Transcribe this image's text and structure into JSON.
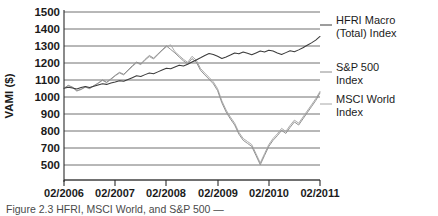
{
  "chart_data": {
    "type": "line",
    "title": "",
    "xlabel": "",
    "ylabel": "VAMI ($)",
    "ylim": [
      400,
      1500
    ],
    "xlim": [
      "02/2006",
      "02/2011"
    ],
    "grid": true,
    "legend_position": "right-inline",
    "y_ticks": [
      "1500",
      "1400",
      "1300",
      "1200",
      "1100",
      "1000",
      "900",
      "800",
      "700",
      "500"
    ],
    "x_ticks": [
      "02/2006",
      "02/2007",
      "02/2008",
      "02/2009",
      "02/2010",
      "02/2011"
    ],
    "series": [
      {
        "name": "HFRI Macro (Total) Index",
        "color": "#3b3b3b",
        "x": [
          0,
          1,
          2,
          3,
          4,
          5,
          6,
          7,
          8,
          9,
          10,
          11,
          12,
          13,
          14,
          15,
          16,
          17,
          18,
          19,
          20,
          21,
          22,
          23,
          24,
          25,
          26,
          27,
          28,
          29,
          30,
          31,
          32,
          33,
          34,
          35,
          36,
          37,
          38,
          39,
          40,
          41,
          42,
          43,
          44,
          45,
          46,
          47,
          48,
          49,
          50,
          51,
          52,
          53,
          54,
          55,
          56,
          57,
          58,
          59,
          60
        ],
        "values": [
          1000,
          1008,
          1002,
          996,
          1005,
          1012,
          1006,
          1014,
          1022,
          1030,
          1026,
          1035,
          1042,
          1050,
          1046,
          1058,
          1070,
          1082,
          1078,
          1090,
          1100,
          1096,
          1108,
          1120,
          1132,
          1128,
          1140,
          1152,
          1146,
          1158,
          1172,
          1186,
          1200,
          1215,
          1228,
          1222,
          1210,
          1196,
          1206,
          1218,
          1232,
          1226,
          1238,
          1230,
          1220,
          1232,
          1244,
          1238,
          1250,
          1244,
          1232,
          1222,
          1234,
          1246,
          1240,
          1252,
          1266,
          1282,
          1298,
          1316,
          1340
        ]
      },
      {
        "name": "S&P 500 Index",
        "color": "#8c8c8c",
        "x": [
          0,
          1,
          2,
          3,
          4,
          5,
          6,
          7,
          8,
          9,
          10,
          11,
          12,
          13,
          14,
          15,
          16,
          17,
          18,
          19,
          20,
          21,
          22,
          23,
          24,
          25,
          26,
          27,
          28,
          29,
          30,
          31,
          32,
          33,
          34,
          35,
          36,
          37,
          38,
          39,
          40,
          41,
          42,
          43,
          44,
          45,
          46,
          47,
          48,
          49,
          50,
          51,
          52,
          53,
          54,
          55,
          56,
          57,
          58,
          59,
          60
        ],
        "values": [
          1000,
          1020,
          1008,
          985,
          995,
          1010,
          1000,
          1018,
          1035,
          1055,
          1040,
          1062,
          1085,
          1105,
          1092,
          1120,
          1148,
          1172,
          1160,
          1190,
          1215,
          1198,
          1225,
          1252,
          1278,
          1255,
          1232,
          1205,
          1180,
          1160,
          1195,
          1172,
          1118,
          1088,
          1060,
          1030,
          985,
          905,
          845,
          800,
          760,
          700,
          660,
          640,
          620,
          560,
          500,
          560,
          620,
          660,
          690,
          725,
          705,
          745,
          780,
          760,
          800,
          840,
          880,
          920,
          970
        ]
      },
      {
        "name": "MSCI World Index",
        "color": "#a6a6a6",
        "x": [
          0,
          1,
          2,
          3,
          4,
          5,
          6,
          7,
          8,
          9,
          10,
          11,
          12,
          13,
          14,
          15,
          16,
          17,
          18,
          19,
          20,
          21,
          22,
          23,
          24,
          25,
          26,
          27,
          28,
          29,
          30,
          31,
          32,
          33,
          34,
          35,
          36,
          37,
          38,
          39,
          40,
          41,
          42,
          43,
          44,
          45,
          46,
          47,
          48,
          49,
          50,
          51,
          52,
          53,
          54,
          55,
          56,
          57,
          58,
          59,
          60
        ],
        "values": [
          1000,
          1018,
          1005,
          982,
          992,
          1008,
          998,
          1016,
          1032,
          1052,
          1038,
          1058,
          1082,
          1100,
          1088,
          1116,
          1142,
          1168,
          1155,
          1185,
          1208,
          1192,
          1220,
          1248,
          1272,
          1285,
          1240,
          1215,
          1190,
          1170,
          1210,
          1185,
          1130,
          1100,
          1072,
          1042,
          998,
          918,
          858,
          812,
          772,
          712,
          672,
          652,
          632,
          572,
          512,
          572,
          632,
          672,
          702,
          738,
          718,
          758,
          792,
          772,
          812,
          852,
          892,
          932,
          980
        ]
      }
    ]
  },
  "legend": {
    "items": [
      {
        "label_line1": "HFRI Macro",
        "label_line2": "(Total) Index"
      },
      {
        "label_line1": "S&P 500",
        "label_line2": "Index"
      },
      {
        "label_line1": "MSCI World",
        "label_line2": "Index"
      }
    ]
  },
  "caption": {
    "text": "Figure 2.3  HFRI, MSCI World, and S&P 500 — "
  }
}
